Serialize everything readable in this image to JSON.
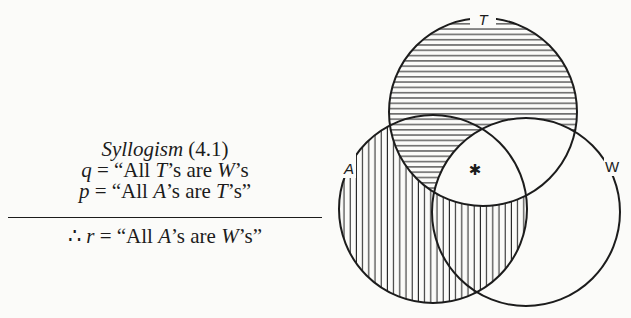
{
  "syllogism": {
    "title_italic": "Syllogism",
    "title_number": " (4.1)",
    "premise_q": {
      "var": "q",
      "eq": " = “All ",
      "s1": "T",
      "mid": "’s are ",
      "s2": "W",
      "end": "’s"
    },
    "premise_p": {
      "var": "p",
      "eq": " = “All ",
      "s1": "A",
      "mid": "’s are ",
      "s2": "T",
      "end": "’s”"
    },
    "conclusion": {
      "therefore": "∴ ",
      "var": "r",
      "eq": " = “All ",
      "s1": "A",
      "mid": "’s are ",
      "s2": "W",
      "end": "’s”"
    }
  },
  "venn": {
    "circles": [
      {
        "label": "T",
        "cx": 483,
        "cy": 112,
        "r": 94,
        "hatch": "horizontal"
      },
      {
        "label": "A",
        "cx": 433,
        "cy": 209,
        "r": 94,
        "hatch": "vertical"
      },
      {
        "label": "W",
        "cx": 526,
        "cy": 212,
        "r": 94,
        "hatch": "none"
      }
    ],
    "marker": "✱",
    "labels": {
      "T": "T",
      "A": "A",
      "W": "W"
    }
  }
}
